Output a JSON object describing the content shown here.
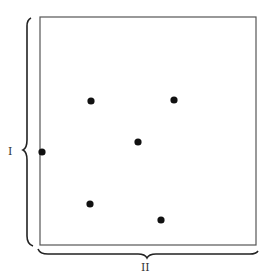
{
  "diagram": {
    "labels": {
      "vertical": "I",
      "horizontal": "II"
    },
    "box": {
      "x": 40,
      "y": 17,
      "width": 216,
      "height": 228
    },
    "points": [
      {
        "x": 91,
        "y": 101
      },
      {
        "x": 174,
        "y": 100
      },
      {
        "x": 138,
        "y": 142
      },
      {
        "x": 42,
        "y": 152
      },
      {
        "x": 90,
        "y": 204
      },
      {
        "x": 161,
        "y": 220
      }
    ],
    "colors": {
      "stroke": "#333333",
      "dot": "#111111"
    }
  }
}
